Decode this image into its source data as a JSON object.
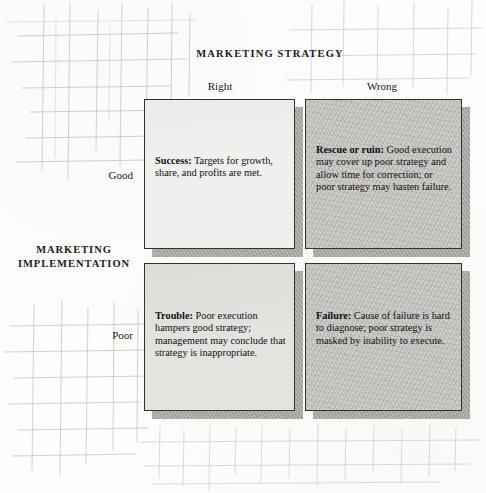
{
  "diagram": {
    "column_axis_title": "MARKETING STRATEGY",
    "row_axis_title_line1": "MARKETING",
    "row_axis_title_line2": "IMPLEMENTATION",
    "column_headers": [
      "Right",
      "Wrong"
    ],
    "row_headers": [
      "Good",
      "Poor"
    ],
    "cells": [
      {
        "id": "good-right",
        "term": "Success",
        "separator": ":",
        "body": " Targets for growth, share, and profits are met."
      },
      {
        "id": "good-wrong",
        "term": "Rescue or ruin",
        "separator": ":",
        "body": " Good execution may cover up poor strategy and allow time for correction; or poor strategy may hasten failure."
      },
      {
        "id": "poor-right",
        "term": "Trouble",
        "separator": ":",
        "body": " Poor execution hampers good strategy; management may conclude that strategy is inappropriate."
      },
      {
        "id": "poor-wrong",
        "term": "Failure",
        "separator": ":",
        "body": " Cause of failure is hard to diagnose; poor strategy is masked by inability to execute."
      }
    ],
    "colors": {
      "page_background": "#fdfdfc",
      "cell_border": "#33322f",
      "cell_light": "#efefed",
      "cell_mid": "#e3e3e0",
      "cell_dark": "#cfcfcb",
      "shadow": "#aeaea9",
      "grid_line": "#b9b9b6",
      "text": "#141414"
    }
  }
}
